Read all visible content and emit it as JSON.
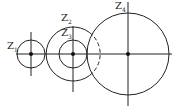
{
  "diagram": {
    "gears": [
      {
        "id": "z1",
        "label": "Z",
        "sub": "1",
        "cx": 31,
        "cy": 54,
        "r": 14
      },
      {
        "id": "z2",
        "label": "Z",
        "sub": "2",
        "cx": 73,
        "cy": 54,
        "r": 27
      },
      {
        "id": "z3",
        "label": "Z",
        "sub": "3",
        "cx": 73,
        "cy": 54,
        "r": 14
      },
      {
        "id": "z4",
        "label": "Z",
        "sub": "4",
        "cx": 128,
        "cy": 54,
        "r": 41
      }
    ],
    "line_color": "#222222"
  }
}
